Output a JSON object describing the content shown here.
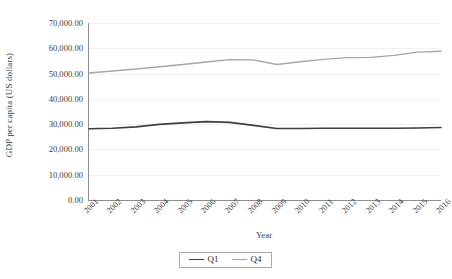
{
  "chart_data": {
    "type": "line",
    "title": "",
    "xlabel": "Year",
    "ylabel": "GDP per capita (US dollars)",
    "categories": [
      "2001",
      "2002",
      "2003",
      "2004",
      "2005",
      "2006",
      "2007",
      "2008",
      "2009",
      "2010",
      "2011",
      "2012",
      "2013",
      "2014",
      "2015",
      "2016"
    ],
    "ylim": [
      0,
      70000
    ],
    "ytick_labels": [
      "0.00",
      "10,000.00",
      "20,000.00",
      "30,000.00",
      "40,000.00",
      "50,000.00",
      "60,000.00",
      "70,000.00"
    ],
    "ytick_values": [
      0,
      10000,
      20000,
      30000,
      40000,
      50000,
      60000,
      70000
    ],
    "grid": true,
    "legend_position": "bottom",
    "series": [
      {
        "name": "Q1",
        "color": "#3f3f3f",
        "width": 1.6,
        "values": [
          28200,
          28400,
          28900,
          29900,
          30500,
          31000,
          30700,
          29500,
          28300,
          28300,
          28400,
          28400,
          28400,
          28400,
          28500,
          28700
        ]
      },
      {
        "name": "Q4",
        "color": "#a6a6a6",
        "width": 1.4,
        "values": [
          50200,
          51000,
          51800,
          52700,
          53600,
          54600,
          55500,
          55400,
          53600,
          54700,
          55600,
          56300,
          56400,
          57200,
          58500,
          58800
        ]
      }
    ]
  },
  "axis": {
    "y_title": "GDP per capita (US dollars)",
    "x_title": "Year"
  },
  "legend": {
    "items": [
      {
        "label": "Q1",
        "color": "#3f3f3f"
      },
      {
        "label": "Q4",
        "color": "#a6a6a6"
      }
    ]
  }
}
